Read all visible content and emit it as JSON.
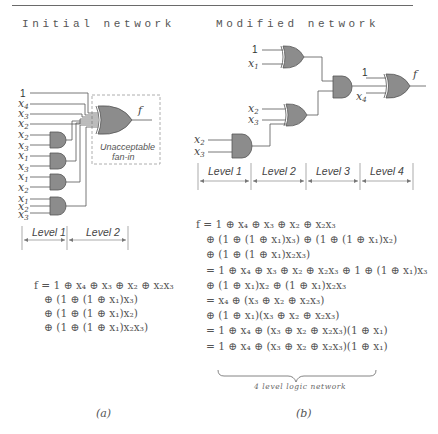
{
  "headings": {
    "left": "Initial network",
    "right": "Modified network"
  },
  "left_diagram": {
    "inputs": [
      "1",
      "x4",
      "x3",
      "x2",
      "x2",
      "x3",
      "x1",
      "x3",
      "x1",
      "x2",
      "x1",
      "x2",
      "x3"
    ],
    "output_label": "f",
    "annotation_line1": "Unacceptable",
    "annotation_line2": "fan-in",
    "levels": [
      "Level 1",
      "Level 2"
    ]
  },
  "right_diagram": {
    "gate1_inputs": [
      "1",
      "x1"
    ],
    "gate_mid_inputs": [
      "x2",
      "x3"
    ],
    "gate_low_inputs": [
      "x2",
      "x3"
    ],
    "final_inputs": [
      "1",
      "x4"
    ],
    "output_label": "f",
    "levels": [
      "Level 1",
      "Level 2",
      "Level 3",
      "Level 4"
    ]
  },
  "equations": {
    "left": [
      "f = 1 ⊕ x₄ ⊕ x₃ ⊕ x₂ ⊕ x₂x₃",
      "⊕ (1 ⊕ (1 ⊕ x₁)x₃)",
      "⊕ (1 ⊕ (1 ⊕ x₁)x₂)",
      "⊕ (1 ⊕ (1 ⊕ x₁)x₂x₃)"
    ],
    "right": [
      "f = 1 ⊕ x₄ ⊕ x₃ ⊕ x₂ ⊕ x₂x₃",
      "⊕ (1 ⊕ (1 ⊕ x₁)x₃) ⊕ (1 ⊕ (1 ⊕ x₁)x₂)",
      "⊕ (1 ⊕ (1 ⊕ x₁)x₂x₃)",
      "= 1 ⊕ x₄ ⊕ x₃ ⊕ x₂ ⊕ x₂x₃ ⊕ 1 ⊕ (1 ⊕ x₁)x₃",
      "⊕ (1 ⊕ x₁)x₂ ⊕ (1 ⊕ x₁)x₂x₃",
      "= x₄ ⊕ (x₃ ⊕ x₂ ⊕ x₂x₃)",
      "⊕ (1 ⊕ x₁)(x₃ ⊕ x₂ ⊕ x₂x₃)",
      "= 1 ⊕ x₄ ⊕ (x₃ ⊕ x₂ ⊕ x₂x₃)(1 ⊕ x₁)",
      "= 1 ⊕ x₄ ⊕ (x₃ ⊕ x₂ ⊕ x₂x₃)(1 ⊕ x₁)"
    ],
    "brace_note": "4 level logic network"
  },
  "captions": {
    "left": "(a)",
    "right": "(b)"
  },
  "colors": {
    "gate_fill": "#8c8c8c",
    "wire": "#555555",
    "dashed_box": "#999999"
  }
}
